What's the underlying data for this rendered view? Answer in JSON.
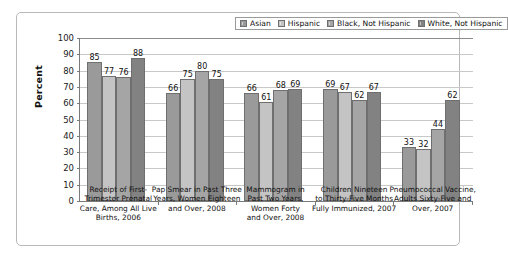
{
  "chart_data": {
    "type": "bar",
    "title": "",
    "xlabel": "",
    "ylabel": "Percent",
    "ylim": [
      0,
      100
    ],
    "ytick_step": 10,
    "yticks": [
      "100",
      "90",
      "80",
      "70",
      "60",
      "50",
      "40",
      "30",
      "20",
      "10",
      "0"
    ],
    "grid": true,
    "legend_position": "top-right-inside",
    "categories": [
      "Receipt of First-Trimester Prenatal Care, Among All Live Births, 2006",
      "Pap Smear in Past Three Years, Women Eighteen and Over, 2008",
      "Mammogram in Past Two Years, Women Forty and Over, 2008",
      "Children Nineteen to Thirty-Five Months Fully Immunized, 2007",
      "Pneumococcal Vaccine, Adults Sixty-Five and Over, 2007"
    ],
    "category_lines": [
      [
        "Receipt of First-",
        "Trimester Prenatal",
        "Care, Among All Live",
        "Births, 2006"
      ],
      [
        "Pap Smear in Past Three",
        "Years, Women Eighteen",
        "and Over, 2008"
      ],
      [
        "Mammogram in",
        "Past Two Years,",
        "Women Forty",
        "and Over, 2008"
      ],
      [
        "Children Nineteen",
        "to Thirty-Five Months",
        "Fully Immunized, 2007"
      ],
      [
        "Pneumococcal Vaccine,",
        "Adults Sixty-Five and",
        "Over, 2007"
      ]
    ],
    "series": [
      {
        "name": "Asian",
        "color": "#9a9a9a",
        "values": [
          85,
          66,
          66,
          69,
          33
        ]
      },
      {
        "name": "Hispanic",
        "color": "#c4c4c4",
        "values": [
          77,
          75,
          61,
          67,
          32
        ]
      },
      {
        "name": "Black, Not Hispanic",
        "color": "#a5a5a5",
        "values": [
          76,
          80,
          68,
          62,
          44
        ]
      },
      {
        "name": "White, Not Hispanic",
        "color": "#828282",
        "values": [
          88,
          75,
          69,
          67,
          62
        ]
      }
    ]
  }
}
